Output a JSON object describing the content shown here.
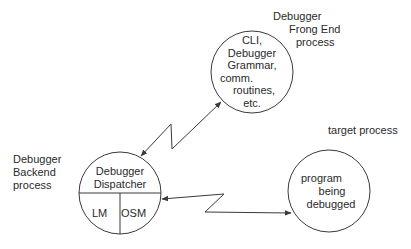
{
  "diagram": {
    "colors": {
      "stroke": "#3a3a3a",
      "text": "#2a2a2a",
      "background": "#ffffff"
    },
    "labels": {
      "frontend_process": [
        "Debugger",
        "Frong End",
        "process"
      ],
      "backend_process": [
        "Debugger",
        "Backend",
        "process"
      ],
      "target_process": "target process"
    },
    "nodes": {
      "frontend": {
        "lines": [
          "CLI,",
          "Debugger",
          "Grammar,",
          "comm.",
          "routines,",
          "etc."
        ]
      },
      "backend": {
        "top_lines": [
          "Debugger",
          "Dispatcher"
        ],
        "bottom_left": "LM",
        "bottom_right": "OSM"
      },
      "target": {
        "lines": [
          "program",
          "being",
          "debugged"
        ]
      }
    },
    "connections": [
      {
        "from": "backend",
        "to": "frontend",
        "style": "lightning",
        "direction": "bidirectional"
      },
      {
        "from": "backend",
        "to": "target",
        "style": "lightning",
        "direction": "bidirectional"
      }
    ]
  }
}
